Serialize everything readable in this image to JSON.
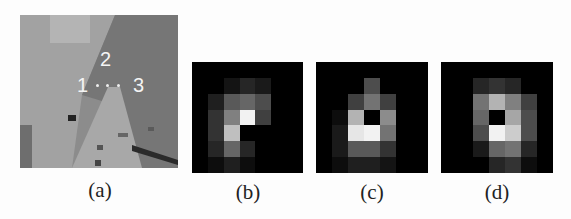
{
  "figure": {
    "panels": [
      {
        "id": "a",
        "caption": "(a)",
        "type": "photo-patch"
      },
      {
        "id": "b",
        "caption": "(b)",
        "type": "heatmap"
      },
      {
        "id": "c",
        "caption": "(c)",
        "type": "heatmap"
      },
      {
        "id": "d",
        "caption": "(d)",
        "type": "heatmap"
      }
    ],
    "annotations": {
      "label_1": "1",
      "label_2": "2",
      "label_3": "3"
    }
  },
  "chart_data": [
    {
      "type": "heatmap",
      "title": "(b)",
      "grid_size": [
        7,
        7
      ],
      "values": [
        [
          0.0,
          0.0,
          0.0,
          0.0,
          0.0,
          0.0,
          0.0
        ],
        [
          0.0,
          0.0,
          0.08,
          0.15,
          0.1,
          0.0,
          0.0
        ],
        [
          0.0,
          0.12,
          0.35,
          0.4,
          0.3,
          0.0,
          0.0
        ],
        [
          0.0,
          0.2,
          0.5,
          0.95,
          0.25,
          0.0,
          0.0
        ],
        [
          0.0,
          0.2,
          0.75,
          0.0,
          0.0,
          0.0,
          0.0
        ],
        [
          0.0,
          0.15,
          0.4,
          0.15,
          0.0,
          0.0,
          0.0
        ],
        [
          0.0,
          0.05,
          0.12,
          0.05,
          0.0,
          0.0,
          0.0
        ]
      ]
    },
    {
      "type": "heatmap",
      "title": "(c)",
      "grid_size": [
        7,
        7
      ],
      "values": [
        [
          0.0,
          0.0,
          0.0,
          0.0,
          0.0,
          0.0,
          0.0
        ],
        [
          0.0,
          0.0,
          0.0,
          0.3,
          0.0,
          0.0,
          0.0
        ],
        [
          0.0,
          0.0,
          0.25,
          0.45,
          0.25,
          0.0,
          0.0
        ],
        [
          0.0,
          0.05,
          0.7,
          0.0,
          0.55,
          0.0,
          0.0
        ],
        [
          0.0,
          0.1,
          0.9,
          0.95,
          0.45,
          0.0,
          0.0
        ],
        [
          0.0,
          0.1,
          0.35,
          0.35,
          0.2,
          0.0,
          0.0
        ],
        [
          0.0,
          0.05,
          0.12,
          0.12,
          0.08,
          0.0,
          0.0
        ]
      ]
    },
    {
      "type": "heatmap",
      "title": "(d)",
      "grid_size": [
        7,
        7
      ],
      "values": [
        [
          0.0,
          0.0,
          0.0,
          0.0,
          0.0,
          0.0,
          0.0
        ],
        [
          0.0,
          0.0,
          0.15,
          0.2,
          0.15,
          0.0,
          0.0
        ],
        [
          0.0,
          0.0,
          0.45,
          0.7,
          0.5,
          0.25,
          0.0
        ],
        [
          0.0,
          0.0,
          0.4,
          0.0,
          0.65,
          0.3,
          0.0
        ],
        [
          0.0,
          0.0,
          0.3,
          0.95,
          0.8,
          0.3,
          0.0
        ],
        [
          0.0,
          0.0,
          0.1,
          0.4,
          0.45,
          0.15,
          0.0
        ],
        [
          0.0,
          0.0,
          0.0,
          0.15,
          0.2,
          0.05,
          0.0
        ]
      ]
    }
  ]
}
